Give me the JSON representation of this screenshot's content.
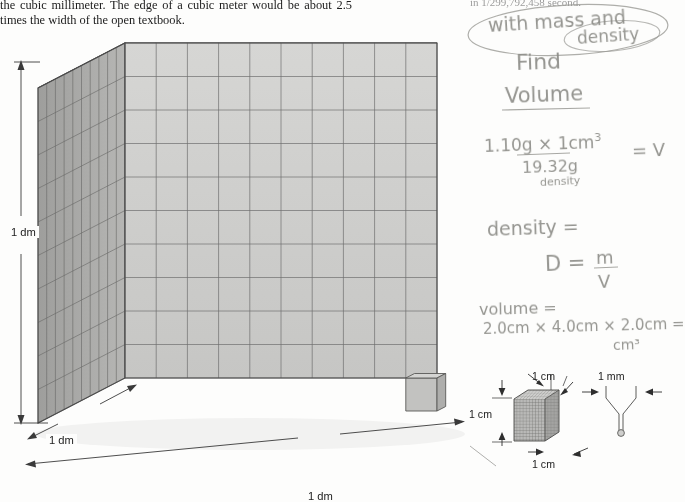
{
  "document": {
    "type": "scanned-textbook-page-with-handwriting",
    "printed_paragraph": "the cubic millimeter. The edge of a cubic meter would be about 2.5 times the width of the open textbook.",
    "printed_fragment_top_right": "in 1/299,792,458 second."
  },
  "main_figure": {
    "name": "cubic-decimeter-cube",
    "grid_divisions": 10,
    "labels": {
      "height": "1 dm",
      "depth": "1 dm",
      "width": "1 dm"
    },
    "colors": {
      "top_face": "#d8d8d6",
      "front_face": "#cfcfcd",
      "left_face": "#a9a9a7",
      "grid_line": "#6e6e6e",
      "outline": "#4a4a4a"
    }
  },
  "small_figures": {
    "cubic_centimeter": {
      "name": "cubic-centimeter-cube",
      "top_label": "1 cm",
      "left_label": "1 cm",
      "bottom_label": "1 cm"
    },
    "cubic_millimeter": {
      "name": "cubic-millimeter-marker",
      "label": "1 mm"
    }
  },
  "handwritten_notes": {
    "prompt_line1": "with mass and",
    "prompt_line2": "density",
    "prompt_line3": "Find",
    "prompt_line4": "Volume",
    "equation1_numerator": "1.10g × 1cm",
    "equation1_numerator_exp": "3",
    "equation1_denominator": "19.32g",
    "equation1_denominator_label": "density",
    "equation1_result": "= V",
    "density_word": "density =",
    "density_formula_d": "D =",
    "density_formula_m": "m",
    "density_formula_v": "V",
    "volume_word": "volume =",
    "volume_calc": "2.0cm × 4.0cm × 2.0cm =",
    "volume_unit": "cm³",
    "ink_color": "#8d8d88"
  }
}
